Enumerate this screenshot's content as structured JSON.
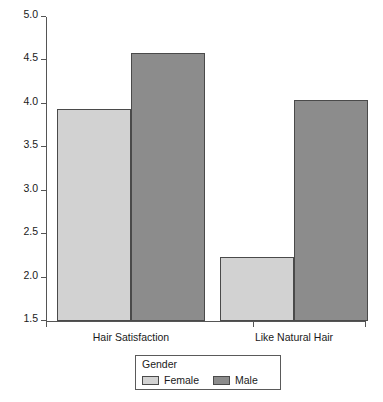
{
  "chart_data": {
    "type": "bar",
    "title": "",
    "xlabel": "",
    "ylabel": "",
    "categories": [
      "Hair Satisfaction",
      "Like Natural Hair"
    ],
    "series": [
      {
        "name": "Female",
        "color": "#d2d2d2",
        "values": [
          3.94,
          2.24
        ]
      },
      {
        "name": "Male",
        "color": "#8c8c8c",
        "values": [
          4.58,
          4.05
        ]
      }
    ],
    "ylim": [
      1.5,
      5.0
    ],
    "ytick_values": [
      5.0,
      4.5,
      4.0,
      3.5,
      3.0,
      2.5,
      2.0,
      1.5
    ],
    "ytick_labels": [
      "5.0",
      "4.5",
      "4.0",
      "3.5",
      "3.0",
      "2.5",
      "2.0",
      "1.5"
    ],
    "grid": false,
    "legend": {
      "title": "Gender",
      "position": "bottom",
      "entries": [
        {
          "label": "Female",
          "color": "#d2d2d2"
        },
        {
          "label": "Male",
          "color": "#8c8c8c"
        }
      ]
    },
    "axis_color": "#555555",
    "bar_border_color": "#4a4a4a",
    "background": "#ffffff"
  }
}
